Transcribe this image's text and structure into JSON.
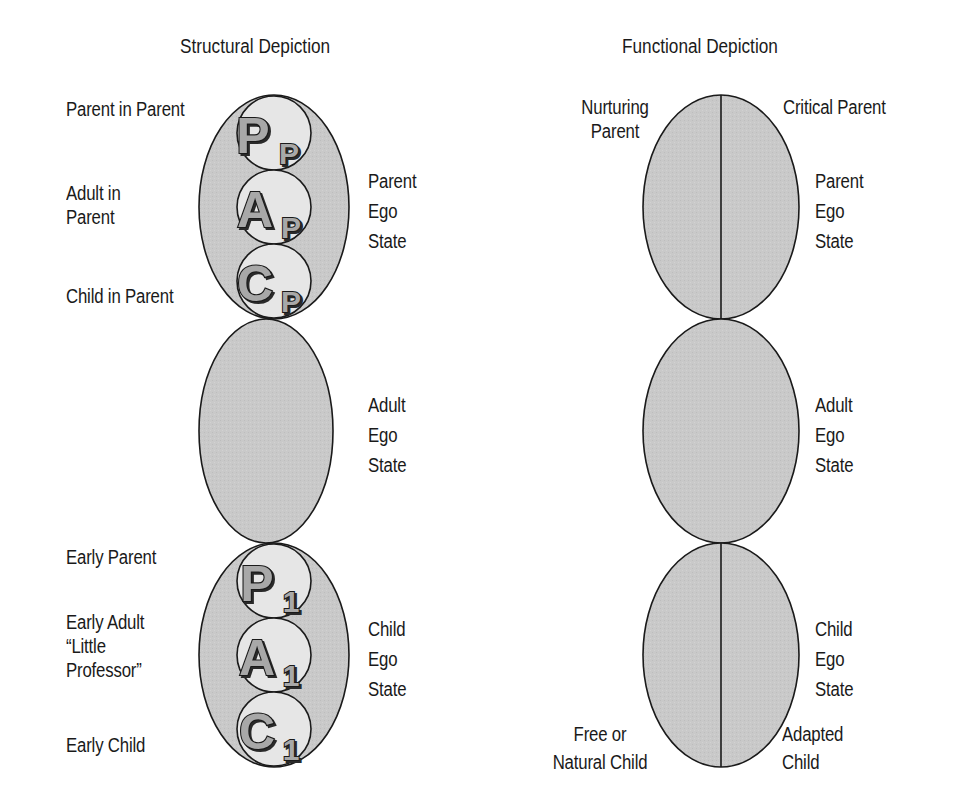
{
  "colors": {
    "ellipse_fill": "#c8c8c8",
    "inner_circle_fill": "#e6e6e6",
    "stroke": "#1a1a1a",
    "glyph_fill": "#a8a8a8",
    "background": "#ffffff"
  },
  "structural": {
    "title": "Structural Depiction",
    "parent_ego_state": {
      "side_label": "Parent\nEgo\nState",
      "circles": [
        {
          "letter": "P",
          "subscript": "P",
          "label": "Parent in Parent"
        },
        {
          "letter": "A",
          "subscript": "P",
          "label": "Adult in\nParent"
        },
        {
          "letter": "C",
          "subscript": "P",
          "label": "Child in Parent"
        }
      ]
    },
    "adult_ego_state": {
      "side_label": "Adult\nEgo\nState"
    },
    "child_ego_state": {
      "side_label": "Child\nEgo\nState",
      "circles": [
        {
          "letter": "P",
          "subscript": "1",
          "label": "Early Parent"
        },
        {
          "letter": "A",
          "subscript": "1",
          "label": "Early Adult\n“Little\nProfessor”"
        },
        {
          "letter": "C",
          "subscript": "1",
          "label": "Early Child"
        }
      ]
    }
  },
  "functional": {
    "title": "Functional Depiction",
    "parent_ego_state": {
      "side_label": "Parent\nEgo\nState",
      "left_label": "Nurturing\nParent",
      "right_label": "Critical Parent"
    },
    "adult_ego_state": {
      "side_label": "Adult\nEgo\nState"
    },
    "child_ego_state": {
      "side_label": "Child\nEgo\nState",
      "left_label": "Free or\nNatural Child",
      "right_label": "Adapted\nChild"
    }
  }
}
